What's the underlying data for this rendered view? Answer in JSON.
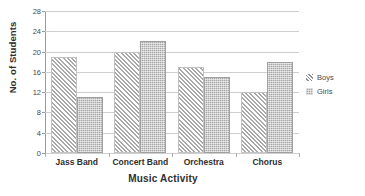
{
  "chart_data": {
    "type": "bar",
    "title": "",
    "subtitle": "",
    "xlabel": "Music Activity",
    "ylabel": "No. of Students",
    "categories": [
      "Jass Band",
      "Concert Band",
      "Orchestra",
      "Chorus"
    ],
    "series": [
      {
        "name": "Boys",
        "values": [
          19,
          20,
          17,
          12
        ],
        "pattern": "diagonal-hatch",
        "color": "#a9a9a9"
      },
      {
        "name": "Girls",
        "values": [
          11,
          22,
          15,
          18
        ],
        "pattern": "stipple-fill",
        "color": "#a7a7a7"
      }
    ],
    "ylim": [
      0,
      28
    ],
    "ytick_labels": [
      "0",
      "4",
      "8",
      "12",
      "16",
      "20",
      "24",
      "28"
    ],
    "ytick_values": [
      0,
      4,
      8,
      12,
      16,
      20,
      24,
      28
    ],
    "grid": "horizontal",
    "grid_color": "#cfcfcf",
    "legend_position": "right",
    "legend_entries": [
      "Boys",
      "Girls"
    ],
    "background_color": "#ffffff",
    "axis_color": "#9a9a9a"
  }
}
